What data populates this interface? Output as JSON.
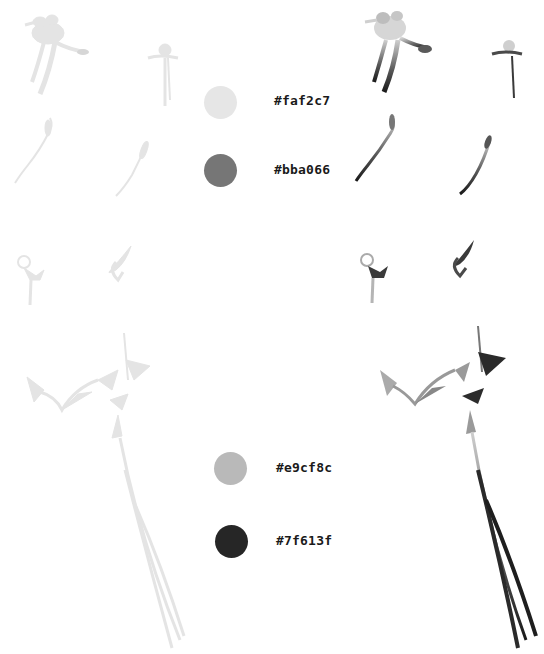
{
  "palette": {
    "top_group": [
      {
        "hex": "#faf2c7",
        "display_color": "#e6e6e6",
        "label": "#faf2c7"
      },
      {
        "hex": "#bba066",
        "display_color": "#767676",
        "label": "#bba066"
      }
    ],
    "bottom_group": [
      {
        "hex": "#e9cf8c",
        "display_color": "#b9b9b9",
        "label": "#e9cf8c"
      },
      {
        "hex": "#7f613f",
        "display_color": "#262626",
        "label": "#7f613f"
      }
    ]
  },
  "artwork": {
    "light_variant_tone": "#e4e4e4",
    "dark_variant_tone": "#2a2a2a",
    "items": [
      "flower-hairpin-large",
      "flower-hairpin-small",
      "feather-pin-a",
      "feather-pin-b",
      "swirl-pin",
      "leaf-pin",
      "ginkgo-crown-with-tassels"
    ]
  }
}
